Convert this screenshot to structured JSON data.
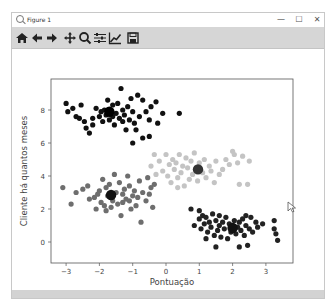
{
  "window": {
    "title": "Figure 1",
    "controls": {
      "minimize": "—",
      "maximize": "☐",
      "close": "✕"
    }
  },
  "toolbar": {
    "buttons": [
      {
        "name": "home-button",
        "icon": "home-icon",
        "tooltip": "Home"
      },
      {
        "name": "back-button",
        "icon": "arrow-left-icon",
        "tooltip": "Back"
      },
      {
        "name": "forward-button",
        "icon": "arrow-right-icon",
        "tooltip": "Forward"
      },
      {
        "name": "pan-button",
        "icon": "move-icon",
        "tooltip": "Pan"
      },
      {
        "name": "zoom-button",
        "icon": "magnifier-icon",
        "tooltip": "Zoom"
      },
      {
        "name": "subplots-button",
        "icon": "sliders-icon",
        "tooltip": "Subplots"
      },
      {
        "name": "edit-axis-button",
        "icon": "line-chart-icon",
        "tooltip": "Edit axis"
      },
      {
        "name": "save-button",
        "icon": "floppy-disk-icon",
        "tooltip": "Save"
      }
    ]
  },
  "chart_data": {
    "type": "scatter",
    "title": "",
    "xlabel": "Pontuação",
    "ylabel": "Cliente há quantos meses",
    "xlim": [
      -3.5,
      3.8
    ],
    "ylim": [
      -1.2,
      9.8
    ],
    "xticks": [
      -3,
      -2,
      -1,
      0,
      1,
      2,
      3
    ],
    "yticks": [
      0,
      2,
      4,
      6,
      8
    ],
    "grid": false,
    "legend": null,
    "series": [
      {
        "name": "cluster-0",
        "color": "#111111",
        "center": [
          -1.7,
          7.9
        ],
        "points": [
          [
            -3.0,
            8.4
          ],
          [
            -2.95,
            7.9
          ],
          [
            -2.8,
            8.1
          ],
          [
            -2.6,
            7.5
          ],
          [
            -2.45,
            7.3
          ],
          [
            -2.4,
            6.9
          ],
          [
            -2.3,
            6.6
          ],
          [
            -2.2,
            7.5
          ],
          [
            -2.1,
            8.1
          ],
          [
            -2.0,
            7.6
          ],
          [
            -1.95,
            7.9
          ],
          [
            -1.9,
            7.3
          ],
          [
            -1.85,
            8.0
          ],
          [
            -1.8,
            7.7
          ],
          [
            -1.75,
            8.6
          ],
          [
            -1.7,
            7.4
          ],
          [
            -1.65,
            7.9
          ],
          [
            -1.6,
            8.3
          ],
          [
            -1.55,
            7.1
          ],
          [
            -1.5,
            7.8
          ],
          [
            -1.45,
            8.4
          ],
          [
            -1.4,
            7.5
          ],
          [
            -1.35,
            9.3
          ],
          [
            -1.3,
            8.0
          ],
          [
            -1.25,
            7.7
          ],
          [
            -1.2,
            6.8
          ],
          [
            -1.15,
            8.2
          ],
          [
            -1.1,
            7.4
          ],
          [
            -1.05,
            8.7
          ],
          [
            -1.0,
            7.9
          ],
          [
            -0.95,
            7.2
          ],
          [
            -0.9,
            6.8
          ],
          [
            -0.85,
            8.9
          ],
          [
            -0.8,
            7.6
          ],
          [
            -0.7,
            8.6
          ],
          [
            -0.6,
            7.9
          ],
          [
            -0.5,
            7.4
          ],
          [
            -0.45,
            8.2
          ],
          [
            -0.3,
            8.5
          ],
          [
            -0.25,
            7.2
          ],
          [
            -0.1,
            7.8
          ],
          [
            0.4,
            7.8
          ],
          [
            -2.55,
            8.3
          ],
          [
            -2.2,
            7.1
          ],
          [
            -1.0,
            6.0
          ],
          [
            -0.7,
            6.3
          ],
          [
            -0.5,
            6.4
          ],
          [
            -1.3,
            7.3
          ],
          [
            -1.6,
            7.6
          ],
          [
            -2.7,
            7.6
          ]
        ]
      },
      {
        "name": "cluster-1",
        "color": "#6e6e6e",
        "center": [
          -1.6,
          2.85
        ],
        "points": [
          [
            -3.1,
            3.3
          ],
          [
            -2.85,
            2.3
          ],
          [
            -2.7,
            3.0
          ],
          [
            -2.5,
            3.2
          ],
          [
            -2.35,
            3.4
          ],
          [
            -2.3,
            2.6
          ],
          [
            -2.15,
            2.7
          ],
          [
            -2.1,
            2.0
          ],
          [
            -2.0,
            3.1
          ],
          [
            -1.95,
            2.4
          ],
          [
            -1.9,
            3.8
          ],
          [
            -1.85,
            2.2
          ],
          [
            -1.8,
            3.3
          ],
          [
            -1.75,
            2.8
          ],
          [
            -1.7,
            3.5
          ],
          [
            -1.65,
            2.1
          ],
          [
            -1.6,
            2.5
          ],
          [
            -1.55,
            4.1
          ],
          [
            -1.5,
            3.0
          ],
          [
            -1.45,
            2.3
          ],
          [
            -1.4,
            3.6
          ],
          [
            -1.35,
            1.6
          ],
          [
            -1.3,
            2.9
          ],
          [
            -1.25,
            3.2
          ],
          [
            -1.2,
            2.6
          ],
          [
            -1.15,
            4.0
          ],
          [
            -1.1,
            3.4
          ],
          [
            -1.05,
            2.0
          ],
          [
            -1.0,
            2.8
          ],
          [
            -0.95,
            3.1
          ],
          [
            -0.9,
            2.2
          ],
          [
            -0.85,
            2.7
          ],
          [
            -0.8,
            3.7
          ],
          [
            -0.75,
            1.2
          ],
          [
            -0.7,
            3.0
          ],
          [
            -0.6,
            2.5
          ],
          [
            -0.55,
            3.9
          ],
          [
            -0.5,
            2.9
          ],
          [
            -0.45,
            3.3
          ],
          [
            -0.4,
            2.1
          ],
          [
            -0.35,
            3.5
          ],
          [
            -1.3,
            2.4
          ],
          [
            -1.8,
            1.9
          ],
          [
            -2.05,
            2.9
          ],
          [
            -1.1,
            2.5
          ]
        ]
      },
      {
        "name": "cluster-2",
        "color": "#c4c4c4",
        "center": [
          0.96,
          4.4
        ],
        "points": [
          [
            -0.45,
            4.6
          ],
          [
            -0.3,
            4.1
          ],
          [
            -0.2,
            4.9
          ],
          [
            -0.1,
            4.3
          ],
          [
            0.0,
            5.3
          ],
          [
            0.05,
            4.0
          ],
          [
            0.1,
            4.7
          ],
          [
            0.15,
            3.6
          ],
          [
            0.2,
            5.0
          ],
          [
            0.25,
            4.4
          ],
          [
            0.3,
            4.8
          ],
          [
            0.35,
            3.9
          ],
          [
            0.4,
            5.3
          ],
          [
            0.45,
            4.2
          ],
          [
            0.5,
            4.6
          ],
          [
            0.55,
            3.4
          ],
          [
            0.6,
            5.1
          ],
          [
            0.65,
            4.5
          ],
          [
            0.7,
            3.8
          ],
          [
            0.75,
            4.9
          ],
          [
            0.8,
            4.1
          ],
          [
            0.85,
            5.4
          ],
          [
            0.9,
            4.4
          ],
          [
            0.95,
            3.7
          ],
          [
            1.0,
            4.8
          ],
          [
            1.1,
            4.2
          ],
          [
            1.15,
            5.0
          ],
          [
            1.2,
            3.9
          ],
          [
            1.3,
            4.6
          ],
          [
            1.35,
            4.3
          ],
          [
            1.45,
            3.6
          ],
          [
            1.5,
            4.9
          ],
          [
            1.6,
            4.1
          ],
          [
            1.7,
            4.4
          ],
          [
            1.8,
            5.0
          ],
          [
            1.9,
            4.7
          ],
          [
            2.0,
            5.5
          ],
          [
            2.05,
            5.3
          ],
          [
            2.15,
            4.8
          ],
          [
            2.2,
            3.5
          ],
          [
            2.3,
            5.2
          ],
          [
            2.5,
            4.9
          ],
          [
            2.45,
            3.5
          ],
          [
            0.35,
            3.3
          ],
          [
            -0.35,
            5.3
          ]
        ]
      },
      {
        "name": "cluster-3",
        "color": "#222222",
        "center": [
          2.0,
          0.85
        ],
        "points": [
          [
            0.75,
            2.0
          ],
          [
            0.85,
            1.0
          ],
          [
            1.0,
            1.4
          ],
          [
            1.05,
            0.8
          ],
          [
            1.1,
            1.6
          ],
          [
            1.15,
            1.1
          ],
          [
            1.2,
            1.5
          ],
          [
            1.25,
            0.6
          ],
          [
            1.3,
            1.2
          ],
          [
            1.35,
            0.9
          ],
          [
            1.4,
            1.7
          ],
          [
            1.45,
            0.4
          ],
          [
            1.5,
            1.3
          ],
          [
            1.55,
            0.7
          ],
          [
            1.6,
            1.0
          ],
          [
            1.65,
            0.3
          ],
          [
            1.7,
            1.2
          ],
          [
            1.75,
            0.8
          ],
          [
            1.8,
            1.5
          ],
          [
            1.85,
            0.2
          ],
          [
            1.9,
            1.1
          ],
          [
            1.95,
            0.6
          ],
          [
            2.0,
            1.0
          ],
          [
            2.05,
            1.3
          ],
          [
            2.1,
            0.5
          ],
          [
            2.15,
            0.9
          ],
          [
            2.2,
            1.2
          ],
          [
            2.25,
            0.7
          ],
          [
            2.3,
            1.4
          ],
          [
            2.35,
            0.4
          ],
          [
            2.4,
            1.0
          ],
          [
            2.45,
            -0.2
          ],
          [
            2.5,
            0.8
          ],
          [
            2.55,
            1.5
          ],
          [
            2.6,
            0.6
          ],
          [
            2.7,
            1.2
          ],
          [
            2.75,
            0.9
          ],
          [
            2.4,
            1.6
          ],
          [
            1.0,
            1.9
          ],
          [
            1.2,
            0.2
          ],
          [
            1.6,
            1.6
          ],
          [
            2.9,
            1.1
          ],
          [
            3.25,
            0.8
          ],
          [
            3.3,
            0.5
          ],
          [
            3.35,
            0.1
          ],
          [
            3.25,
            1.3
          ],
          [
            2.2,
            -0.3
          ],
          [
            1.5,
            -0.3
          ]
        ]
      }
    ],
    "centroids": [
      {
        "x": -1.65,
        "y": 2.85,
        "color": "#111111"
      },
      {
        "x": 0.96,
        "y": 4.4,
        "color": "#333333"
      },
      {
        "x": -1.7,
        "y": 7.9,
        "color": "#000000"
      },
      {
        "x": 2.0,
        "y": 0.85,
        "color": "#111111"
      }
    ]
  }
}
